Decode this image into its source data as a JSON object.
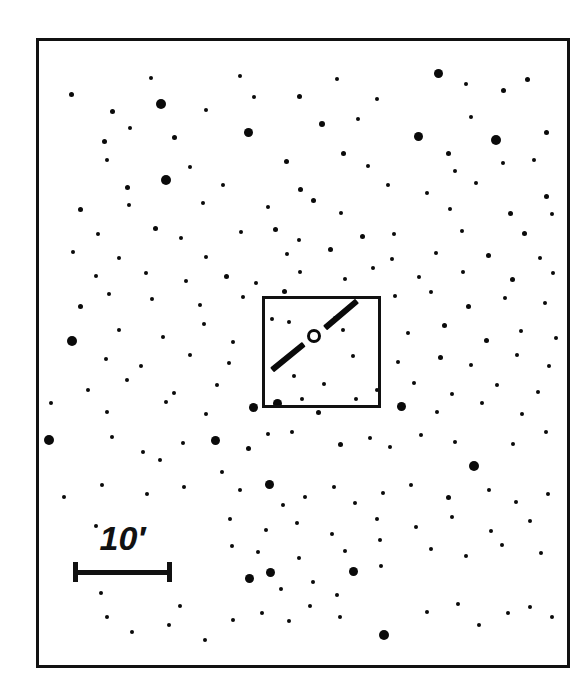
{
  "chart_data": {
    "type": "scatter",
    "title": "",
    "xlabel": "",
    "ylabel": "",
    "grid": false,
    "legend": null,
    "frame": {
      "x": 36,
      "y": 38,
      "width": 534,
      "height": 630
    },
    "scale_bar": {
      "label": "10",
      "unit": "′",
      "label_full": "10′",
      "x1": 73,
      "x2": 172,
      "y": 572,
      "length_px": 99,
      "value_arcmin": 10
    },
    "inset_box": {
      "x": 262,
      "y": 296,
      "width": 119,
      "height": 112
    },
    "target_marker": {
      "shape": "open-circle",
      "cx": 314,
      "cy": 336,
      "r": 7
    },
    "slit": {
      "shape": "diagonal-line",
      "segment_a": {
        "x1": 272,
        "y1": 370,
        "x2": 304,
        "y2": 344
      },
      "segment_b": {
        "x1": 325,
        "y1": 328,
        "x2": 357,
        "y2": 301
      },
      "angle_deg": -40
    },
    "star_magnitude_sizes": {
      "bright": 13,
      "medium": 9,
      "faint": 6,
      "very_faint": 4
    },
    "color": "#0a0a0a",
    "background": "#ffffff",
    "star_count": 186,
    "stars": [
      [
        71,
        94,
        5
      ],
      [
        151,
        78,
        4
      ],
      [
        240,
        76,
        4
      ],
      [
        337,
        79,
        4
      ],
      [
        438,
        73,
        9
      ],
      [
        466,
        84,
        4
      ],
      [
        527,
        79,
        5
      ],
      [
        161,
        104,
        10
      ],
      [
        112,
        111,
        5
      ],
      [
        206,
        110,
        4
      ],
      [
        254,
        97,
        4
      ],
      [
        299,
        96,
        5
      ],
      [
        377,
        99,
        4
      ],
      [
        503,
        90,
        5
      ],
      [
        104,
        141,
        5
      ],
      [
        130,
        128,
        4
      ],
      [
        174,
        137,
        5
      ],
      [
        248,
        132,
        9
      ],
      [
        322,
        124,
        6
      ],
      [
        358,
        119,
        4
      ],
      [
        418,
        136,
        9
      ],
      [
        471,
        117,
        4
      ],
      [
        496,
        140,
        10
      ],
      [
        546,
        132,
        5
      ],
      [
        107,
        160,
        4
      ],
      [
        166,
        180,
        10
      ],
      [
        190,
        167,
        4
      ],
      [
        286,
        161,
        5
      ],
      [
        343,
        153,
        5
      ],
      [
        368,
        166,
        4
      ],
      [
        448,
        153,
        5
      ],
      [
        455,
        171,
        4
      ],
      [
        503,
        163,
        4
      ],
      [
        534,
        160,
        4
      ],
      [
        127,
        187,
        5
      ],
      [
        223,
        185,
        4
      ],
      [
        300,
        189,
        5
      ],
      [
        388,
        185,
        4
      ],
      [
        427,
        193,
        4
      ],
      [
        476,
        183,
        4
      ],
      [
        546,
        196,
        5
      ],
      [
        80,
        209,
        5
      ],
      [
        129,
        205,
        4
      ],
      [
        203,
        203,
        4
      ],
      [
        268,
        207,
        4
      ],
      [
        313,
        200,
        5
      ],
      [
        341,
        213,
        4
      ],
      [
        450,
        209,
        4
      ],
      [
        510,
        213,
        5
      ],
      [
        552,
        214,
        4
      ],
      [
        98,
        234,
        4
      ],
      [
        155,
        228,
        5
      ],
      [
        181,
        238,
        4
      ],
      [
        241,
        232,
        4
      ],
      [
        275,
        229,
        5
      ],
      [
        299,
        240,
        4
      ],
      [
        362,
        236,
        5
      ],
      [
        394,
        234,
        4
      ],
      [
        462,
        231,
        4
      ],
      [
        524,
        233,
        5
      ],
      [
        73,
        252,
        4
      ],
      [
        119,
        258,
        4
      ],
      [
        206,
        257,
        4
      ],
      [
        287,
        254,
        4
      ],
      [
        330,
        249,
        5
      ],
      [
        392,
        259,
        4
      ],
      [
        436,
        253,
        4
      ],
      [
        488,
        255,
        5
      ],
      [
        540,
        258,
        4
      ],
      [
        96,
        276,
        4
      ],
      [
        146,
        273,
        4
      ],
      [
        186,
        281,
        4
      ],
      [
        226,
        276,
        5
      ],
      [
        256,
        283,
        4
      ],
      [
        300,
        272,
        4
      ],
      [
        345,
        279,
        4
      ],
      [
        373,
        268,
        4
      ],
      [
        419,
        277,
        4
      ],
      [
        463,
        272,
        4
      ],
      [
        512,
        279,
        5
      ],
      [
        553,
        273,
        4
      ],
      [
        80,
        306,
        5
      ],
      [
        109,
        294,
        4
      ],
      [
        152,
        299,
        4
      ],
      [
        200,
        305,
        4
      ],
      [
        243,
        297,
        4
      ],
      [
        284,
        291,
        5
      ],
      [
        395,
        296,
        4
      ],
      [
        431,
        292,
        4
      ],
      [
        468,
        306,
        5
      ],
      [
        505,
        298,
        4
      ],
      [
        545,
        303,
        4
      ],
      [
        72,
        341,
        10
      ],
      [
        119,
        330,
        4
      ],
      [
        163,
        337,
        4
      ],
      [
        204,
        324,
        4
      ],
      [
        233,
        342,
        4
      ],
      [
        272,
        319,
        4
      ],
      [
        289,
        322,
        4
      ],
      [
        408,
        333,
        4
      ],
      [
        444,
        325,
        5
      ],
      [
        486,
        340,
        5
      ],
      [
        521,
        331,
        4
      ],
      [
        556,
        338,
        4
      ],
      [
        106,
        359,
        4
      ],
      [
        141,
        366,
        4
      ],
      [
        190,
        355,
        4
      ],
      [
        229,
        363,
        4
      ],
      [
        335,
        318,
        4
      ],
      [
        343,
        330,
        4
      ],
      [
        353,
        356,
        4
      ],
      [
        398,
        362,
        4
      ],
      [
        440,
        357,
        5
      ],
      [
        471,
        365,
        4
      ],
      [
        517,
        355,
        4
      ],
      [
        549,
        366,
        4
      ],
      [
        88,
        390,
        4
      ],
      [
        127,
        380,
        4
      ],
      [
        174,
        393,
        4
      ],
      [
        217,
        385,
        4
      ],
      [
        294,
        376,
        4
      ],
      [
        302,
        399,
        4
      ],
      [
        324,
        384,
        4
      ],
      [
        377,
        390,
        4
      ],
      [
        414,
        383,
        4
      ],
      [
        452,
        394,
        4
      ],
      [
        497,
        385,
        4
      ],
      [
        538,
        392,
        4
      ],
      [
        51,
        403,
        4
      ],
      [
        107,
        412,
        4
      ],
      [
        166,
        402,
        4
      ],
      [
        206,
        414,
        4
      ],
      [
        253,
        407,
        9
      ],
      [
        277,
        403,
        9
      ],
      [
        318,
        412,
        5
      ],
      [
        356,
        399,
        4
      ],
      [
        401,
        406,
        9
      ],
      [
        437,
        412,
        4
      ],
      [
        482,
        403,
        4
      ],
      [
        522,
        414,
        4
      ],
      [
        49,
        440,
        10
      ],
      [
        112,
        437,
        4
      ],
      [
        143,
        452,
        4
      ],
      [
        160,
        460,
        4
      ],
      [
        183,
        443,
        4
      ],
      [
        215,
        440,
        9
      ],
      [
        248,
        448,
        5
      ],
      [
        268,
        434,
        4
      ],
      [
        292,
        432,
        4
      ],
      [
        340,
        444,
        5
      ],
      [
        370,
        438,
        4
      ],
      [
        390,
        447,
        4
      ],
      [
        421,
        435,
        4
      ],
      [
        455,
        442,
        4
      ],
      [
        474,
        466,
        10
      ],
      [
        513,
        444,
        4
      ],
      [
        546,
        432,
        4
      ],
      [
        64,
        497,
        4
      ],
      [
        102,
        485,
        4
      ],
      [
        147,
        494,
        4
      ],
      [
        184,
        487,
        4
      ],
      [
        222,
        472,
        4
      ],
      [
        240,
        490,
        4
      ],
      [
        269,
        484,
        9
      ],
      [
        283,
        505,
        4
      ],
      [
        305,
        497,
        4
      ],
      [
        334,
        487,
        4
      ],
      [
        355,
        503,
        4
      ],
      [
        383,
        493,
        4
      ],
      [
        411,
        485,
        4
      ],
      [
        448,
        497,
        5
      ],
      [
        489,
        490,
        4
      ],
      [
        516,
        502,
        4
      ],
      [
        548,
        494,
        4
      ],
      [
        96,
        526,
        4
      ],
      [
        230,
        519,
        4
      ],
      [
        266,
        530,
        4
      ],
      [
        297,
        523,
        4
      ],
      [
        332,
        534,
        4
      ],
      [
        377,
        519,
        4
      ],
      [
        416,
        527,
        4
      ],
      [
        452,
        517,
        4
      ],
      [
        491,
        531,
        4
      ],
      [
        530,
        521,
        4
      ],
      [
        109,
        545,
        4
      ],
      [
        232,
        546,
        4
      ],
      [
        258,
        552,
        4
      ],
      [
        299,
        558,
        4
      ],
      [
        345,
        551,
        4
      ],
      [
        380,
        540,
        4
      ],
      [
        431,
        549,
        4
      ],
      [
        466,
        556,
        4
      ],
      [
        502,
        545,
        4
      ],
      [
        541,
        553,
        4
      ],
      [
        101,
        593,
        4
      ],
      [
        107,
        617,
        4
      ],
      [
        180,
        606,
        4
      ],
      [
        249,
        578,
        9
      ],
      [
        270,
        572,
        9
      ],
      [
        281,
        589,
        4
      ],
      [
        313,
        582,
        4
      ],
      [
        337,
        595,
        4
      ],
      [
        353,
        571,
        9
      ],
      [
        381,
        566,
        4
      ],
      [
        233,
        620,
        4
      ],
      [
        262,
        613,
        4
      ],
      [
        289,
        621,
        4
      ],
      [
        310,
        606,
        4
      ],
      [
        340,
        617,
        4
      ],
      [
        384,
        635,
        10
      ],
      [
        427,
        612,
        4
      ],
      [
        458,
        604,
        4
      ],
      [
        479,
        625,
        4
      ],
      [
        508,
        613,
        4
      ],
      [
        530,
        607,
        4
      ],
      [
        552,
        617,
        4
      ],
      [
        132,
        632,
        4
      ],
      [
        169,
        625,
        4
      ],
      [
        205,
        640,
        4
      ]
    ]
  }
}
